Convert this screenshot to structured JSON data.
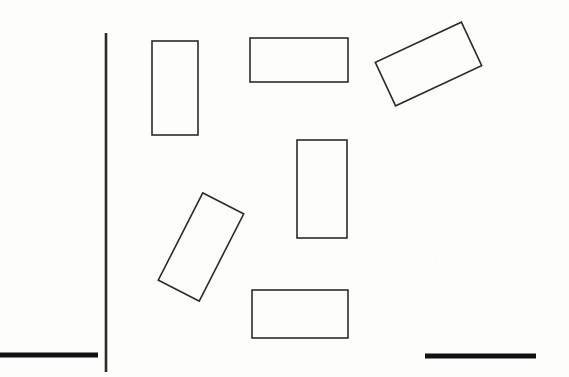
{
  "figure": {
    "title": "Scanned line drawing of rectangles with rule marks",
    "width": 569,
    "height": 377,
    "background_color": "#fdfdfc",
    "stroke_color": "#2b2b2b",
    "heavy_stroke_color": "#111111",
    "thin_stroke_width": 1.6,
    "heavy_stroke_width": 5,
    "shapes": [
      {
        "id": "rect-tall-left",
        "label": "upright tall rectangle, upper left",
        "kind": "rectangle",
        "x": 152,
        "y": 41,
        "width": 46,
        "height": 94,
        "rotation_deg": 0,
        "fill": "none"
      },
      {
        "id": "rect-wide-top",
        "label": "upright wide rectangle, top middle",
        "kind": "rectangle",
        "x": 250,
        "y": 38,
        "width": 98,
        "height": 44,
        "rotation_deg": 0,
        "fill": "none"
      },
      {
        "id": "rect-tilted-top-right",
        "label": "tilted wide rectangle, upper right",
        "kind": "rectangle",
        "x": 381,
        "y": 40,
        "width": 95,
        "height": 48,
        "rotation_deg": -25,
        "fill": "none"
      },
      {
        "id": "rect-tall-middle",
        "label": "upright tall rectangle, center",
        "kind": "rectangle",
        "x": 297,
        "y": 140,
        "width": 50,
        "height": 98,
        "rotation_deg": 0,
        "fill": "none"
      },
      {
        "id": "rect-tilted-middle-left",
        "label": "tilted tall rectangle, lower left of center",
        "kind": "rectangle",
        "x": 178,
        "y": 198,
        "width": 46,
        "height": 98,
        "rotation_deg": 27,
        "fill": "none"
      },
      {
        "id": "rect-wide-bottom",
        "label": "upright wide rectangle, bottom middle",
        "kind": "rectangle",
        "x": 252,
        "y": 290,
        "width": 96,
        "height": 48,
        "rotation_deg": 0,
        "fill": "none"
      }
    ],
    "rules": [
      {
        "id": "rule-vertical",
        "label": "vertical rule near left edge",
        "kind": "line",
        "orientation": "vertical",
        "x1": 106,
        "y1": 33,
        "x2": 106,
        "y2": 372,
        "stroke_width": 2.6
      },
      {
        "id": "rule-horizontal-left",
        "label": "heavy horizontal bar, bottom left",
        "kind": "line",
        "orientation": "horizontal",
        "x1": 0,
        "y1": 355,
        "x2": 98,
        "y2": 355,
        "stroke_width": 5
      },
      {
        "id": "rule-horizontal-right",
        "label": "heavy horizontal bar, bottom right",
        "kind": "line",
        "orientation": "horizontal",
        "x1": 425,
        "y1": 356,
        "x2": 536,
        "y2": 356,
        "stroke_width": 5
      }
    ]
  }
}
